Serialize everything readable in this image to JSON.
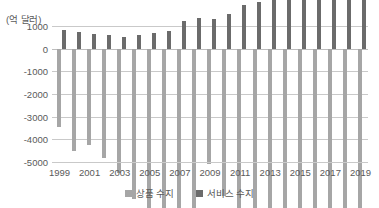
{
  "chart_data": {
    "type": "bar",
    "title": "",
    "subtitle": "",
    "xlabel": "",
    "ylabel": "(억 달러)",
    "unit_caption": "(억 달러)",
    "grid": true,
    "legend_position": "bottom",
    "ylim": [
      -5000,
      1000
    ],
    "ytick_step": 1000,
    "yticks": [
      "1000",
      "0",
      "-1000",
      "-2000",
      "-3000",
      "-4000",
      "-5000"
    ],
    "ytick_values": [
      1000,
      0,
      -1000,
      -2000,
      -3000,
      -4000,
      -5000
    ],
    "categories": [
      1999,
      2000,
      2001,
      2002,
      2003,
      2004,
      2005,
      2006,
      2007,
      2008,
      2009,
      2010,
      2011,
      2012,
      2013,
      2014,
      2015,
      2016,
      2017,
      2018,
      2019
    ],
    "xticks": [
      "1999",
      "2001",
      "2003",
      "2005",
      "2007",
      "2009",
      "2011",
      "2013",
      "2015",
      "2017",
      "2019"
    ],
    "xtick_values": [
      1999,
      2001,
      2003,
      2005,
      2007,
      2009,
      2011,
      2013,
      2015,
      2017,
      2019
    ],
    "series": [
      {
        "name": "상품 수지",
        "color": "#a6a6a6",
        "values": [
          -3460,
          -4520,
          -4270,
          -4820,
          -5470,
          -6650,
          -7820,
          -8370,
          -8190,
          -8320,
          -5090,
          -6500,
          -7410,
          -7410,
          -7020,
          -7520,
          -7620,
          -7510,
          -8070,
          -8870,
          -8640
        ]
      },
      {
        "name": "서비스 수지",
        "color": "#6b6b6b",
        "values": [
          820,
          740,
          640,
          610,
          520,
          600,
          690,
          800,
          1210,
          1350,
          1320,
          1540,
          1910,
          2040,
          2390,
          2620,
          2630,
          2480,
          2550,
          2620,
          2870
        ]
      }
    ],
    "legend": [
      {
        "label": "상품 수지",
        "color": "#a6a6a6"
      },
      {
        "label": "서비스 수지",
        "color": "#6b6b6b"
      }
    ]
  }
}
